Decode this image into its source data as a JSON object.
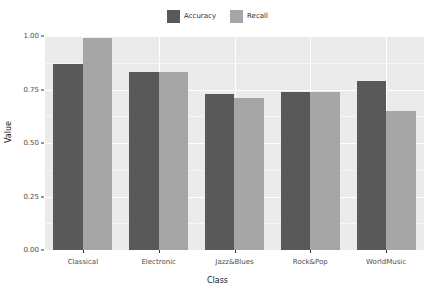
{
  "chart_data": {
    "type": "bar",
    "title": "",
    "xlabel": "Class",
    "ylabel": "Value",
    "categories": [
      "Classical",
      "Electronic",
      "Jazz&Blues",
      "Rock&Pop",
      "WorldMusic"
    ],
    "series": [
      {
        "name": "Accuracy",
        "color": "#595959",
        "values": [
          0.87,
          0.83,
          0.73,
          0.74,
          0.79
        ]
      },
      {
        "name": "Recall",
        "color": "#a6a6a6",
        "values": [
          0.99,
          0.83,
          0.71,
          0.74,
          0.65
        ]
      }
    ],
    "ylim": [
      0.0,
      1.0
    ],
    "yticks": [
      0.0,
      0.25,
      0.5,
      0.75,
      1.0
    ],
    "ytick_labels": [
      "0.00",
      "0.25",
      "0.50",
      "0.75",
      "1.00"
    ],
    "grid": true,
    "legend_position": "top",
    "panel_background": "#ebebeb",
    "gridline_color": "#ffffff"
  }
}
